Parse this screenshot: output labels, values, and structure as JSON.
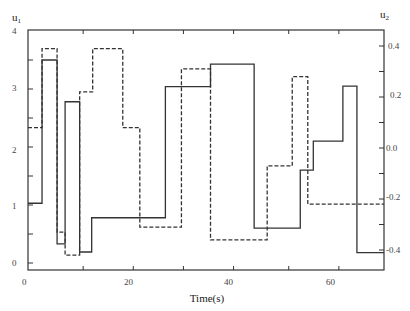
{
  "chart_data": {
    "type": "line",
    "step": true,
    "title": "",
    "xlabel": "Time(s)",
    "ylabel_left": "u1",
    "ylabel_right": "u2",
    "xlim": [
      0,
      71
    ],
    "ylim_left": [
      -0.15,
      4.0
    ],
    "ylim_right": [
      -0.48,
      0.46
    ],
    "x_ticks": [
      0,
      20,
      40,
      60
    ],
    "y_ticks_left": [
      0,
      1,
      2,
      3,
      4
    ],
    "y_ticks_right": [
      -0.4,
      -0.2,
      0.0,
      0.2,
      0.4
    ],
    "grid": false,
    "legend": null,
    "series": [
      {
        "name": "u1",
        "axis": "left",
        "style": "solid",
        "steps": [
          [
            0,
            1.03
          ],
          [
            2.8,
            3.5
          ],
          [
            5.8,
            0.33
          ],
          [
            7.4,
            2.78
          ],
          [
            10.3,
            0.19
          ],
          [
            12.7,
            0.78
          ],
          [
            27.4,
            3.04
          ],
          [
            36.4,
            3.43
          ],
          [
            45.1,
            0.6
          ],
          [
            54.3,
            1.6
          ],
          [
            56.9,
            2.1
          ],
          [
            62.8,
            3.05
          ],
          [
            65.6,
            0.18
          ],
          [
            71,
            0.18
          ]
        ]
      },
      {
        "name": "u2",
        "axis": "right",
        "style": "dashed",
        "steps": [
          [
            0,
            0.08
          ],
          [
            2.8,
            0.39
          ],
          [
            5.8,
            -0.33
          ],
          [
            7.4,
            -0.42
          ],
          [
            10.3,
            0.22
          ],
          [
            12.9,
            0.39
          ],
          [
            18.9,
            0.08
          ],
          [
            22.3,
            -0.31
          ],
          [
            30.6,
            0.31
          ],
          [
            36.4,
            -0.36
          ],
          [
            47.7,
            -0.07
          ],
          [
            52.7,
            0.28
          ],
          [
            55.8,
            -0.22
          ],
          [
            71,
            -0.22
          ]
        ]
      }
    ]
  },
  "labels": {
    "u1": "u",
    "u1_sub": "1",
    "u2": "u",
    "u2_sub": "2",
    "xlabel": "Time(s)",
    "x0": "0",
    "x20": "20",
    "x40": "40",
    "x60": "60",
    "yl0": "0",
    "yl1": "1",
    "yl2": "2",
    "yl3": "3",
    "yl4": "4",
    "yr_p4": "0.4",
    "yr_p2": "0.2",
    "yr_0": "0.0",
    "yr_m2": "-0.2",
    "yr_m4": "-0.4"
  }
}
